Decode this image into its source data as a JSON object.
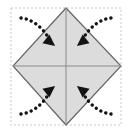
{
  "figure": {
    "type": "origami-fold-diagram",
    "canvas": {
      "width": 132,
      "height": 133,
      "background": "#ffffff"
    },
    "bounding_box": {
      "label": "dashed-guide-box",
      "x": 11,
      "y": 8,
      "width": 110,
      "height": 117,
      "stroke": "#c8c8c8",
      "stroke_width": 1,
      "dash": "2 2",
      "fill": "none"
    },
    "shape": {
      "label": "diamond",
      "description": "square rotated 45 degrees",
      "fill": "#dcdcdc",
      "stroke": "#666666",
      "stroke_width": 1.2,
      "points": "66,8 121,66 66,125 13,66",
      "vertices": [
        {
          "name": "top",
          "x": 66,
          "y": 8
        },
        {
          "name": "right",
          "x": 121,
          "y": 66
        },
        {
          "name": "bottom",
          "x": 66,
          "y": 125
        },
        {
          "name": "left",
          "x": 13,
          "y": 66
        }
      ]
    },
    "crease_lines": [
      {
        "name": "vertical-crease",
        "x1": 66,
        "y1": 8,
        "x2": 66,
        "y2": 125,
        "stroke": "#8a8a8a",
        "stroke_width": 1
      },
      {
        "name": "horizontal-crease",
        "x1": 13,
        "y1": 66,
        "x2": 121,
        "y2": 66,
        "stroke": "#8a8a8a",
        "stroke_width": 1
      }
    ],
    "arrows": [
      {
        "name": "arrow-top-left",
        "direction": "down-right",
        "meaning": "fold top-left corner inward to center",
        "path": "M 21,18 Q 38,20 50,40",
        "head": "48,32 54,45 42,42",
        "head_rotation": 128,
        "color": "#141414",
        "dash": "0.1 5.2",
        "stroke_width": 3.4
      },
      {
        "name": "arrow-top-right",
        "direction": "down-left",
        "meaning": "fold top-right corner inward to center",
        "path": "M 111,18 Q 94,20 82,40",
        "head": "84,32 90,42 78,45",
        "head_rotation": 232,
        "color": "#141414",
        "dash": "0.1 5.2",
        "stroke_width": 3.4
      },
      {
        "name": "arrow-bottom-left",
        "direction": "up-right",
        "meaning": "fold bottom-left corner inward to center",
        "path": "M 21,114 Q 38,112 50,92",
        "head": "48,100 42,90 54,88",
        "head_rotation": 52,
        "color": "#141414",
        "dash": "0.1 5.2",
        "stroke_width": 3.4
      },
      {
        "name": "arrow-bottom-right",
        "direction": "up-left",
        "meaning": "fold bottom-right corner inward to center",
        "path": "M 111,114 Q 94,112 82,92",
        "head": "84,100 78,88 90,90",
        "head_rotation": 308,
        "color": "#141414",
        "dash": "0.1 5.2",
        "stroke_width": 3.4
      }
    ]
  }
}
